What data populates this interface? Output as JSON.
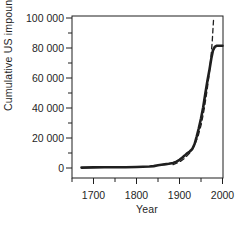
{
  "figure": {
    "background": "#ffffff",
    "ink_color": "#1f1f1f"
  },
  "chart_data": {
    "type": "line",
    "title": "",
    "xlabel": "Year",
    "ylabel": "Cumulative US impounded area (km²)",
    "x_range": [
      1650,
      2005
    ],
    "y_range": [
      -6500,
      101500
    ],
    "grid": false,
    "legend": null,
    "axes": {
      "x_major_ticks": [
        {
          "value": 1700,
          "label": "1700"
        },
        {
          "value": 1800,
          "label": "1800"
        },
        {
          "value": 1900,
          "label": "1900"
        },
        {
          "value": 2000,
          "label": "2000"
        }
      ],
      "x_minor_ticks": [
        1650,
        1750,
        1850,
        1950
      ],
      "y_major_ticks": [
        {
          "value": 0,
          "label": "0"
        },
        {
          "value": 20000,
          "label": "20 000"
        },
        {
          "value": 40000,
          "label": "40 000"
        },
        {
          "value": 60000,
          "label": "60 000"
        },
        {
          "value": 80000,
          "label": "80 000"
        },
        {
          "value": 100000,
          "label": "100 000"
        }
      ],
      "y_minor_ticks": [
        10000,
        30000,
        50000,
        70000,
        90000
      ]
    },
    "series": [
      {
        "name": "cumulative-impounded-area-observed",
        "line_style": "solid",
        "color": "#1f1f1f",
        "x": [
          1672,
          1700,
          1725,
          1750,
          1775,
          1800,
          1815,
          1830,
          1840,
          1850,
          1858,
          1865,
          1875,
          1885,
          1893,
          1900,
          1906,
          1912,
          1918,
          1924,
          1930,
          1935,
          1940,
          1945,
          1950,
          1955,
          1960,
          1965,
          1970,
          1974,
          1978,
          1982,
          1986,
          1992,
          2000
        ],
        "y": [
          300,
          400,
          450,
          500,
          550,
          650,
          800,
          1000,
          1300,
          1800,
          2100,
          2400,
          2800,
          3400,
          4300,
          5500,
          6800,
          8300,
          9800,
          11000,
          12800,
          16000,
          21000,
          26500,
          33000,
          40500,
          49500,
          58000,
          66000,
          73000,
          78500,
          80800,
          81500,
          81500,
          81500
        ]
      },
      {
        "name": "exponential-growth-trend",
        "line_style": "dashed",
        "color": "#1f1f1f",
        "x": [
          1885,
          1900,
          1912,
          1924,
          1934,
          1943,
          1951,
          1958,
          1964,
          1969,
          1973,
          1976,
          1978,
          1979.5
        ],
        "y": [
          2200,
          4000,
          6500,
          10000,
          14500,
          21000,
          29500,
          40000,
          51500,
          62500,
          73500,
          84000,
          93000,
          100500
        ]
      }
    ]
  }
}
